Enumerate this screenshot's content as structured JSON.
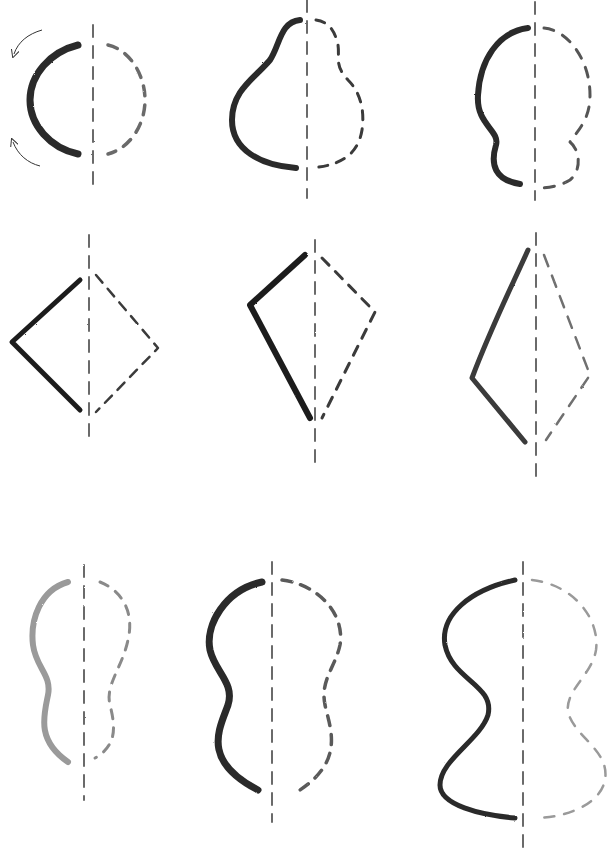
{
  "figure": {
    "colors": {
      "background": "#ffffff",
      "dark_pencil": "#2a2a2a",
      "mid_pencil": "#555555",
      "light_pencil": "#9a9a9a"
    },
    "rows": [
      {
        "name": "round-shapes",
        "shapes": [
          {
            "id": "circle",
            "axis": [
              93,
              25,
              93,
              185
            ],
            "solid": "M 78 45 C 50 52 30 75 30 100 C 30 125 50 148 78 154",
            "dashed": "M 108 45 C 130 50 145 75 145 100 C 145 125 130 148 108 154",
            "stroke": "#2a2a2a",
            "width": 7,
            "dashColor": "#6a6a6a",
            "dash": "10 9",
            "arrows": true
          },
          {
            "id": "pear",
            "axis": [
              307,
              0,
              307,
              198
            ],
            "solid": "M 300 20 C 280 22 280 45 270 60 C 255 78 232 90 232 120 C 232 150 260 165 296 168",
            "dashed": "M 316 20 C 330 22 335 32 338 45 C 340 58 334 65 348 80 C 360 92 365 110 362 130 C 358 155 340 166 310 168",
            "stroke": "#2a2a2a",
            "width": 6,
            "dashColor": "#3a3a3a",
            "dash": "9 9",
            "arrows": false
          },
          {
            "id": "bulb",
            "axis": [
              535,
              2,
              535,
              200
            ],
            "solid": "M 528 28 C 498 32 480 60 478 95 C 476 125 500 130 496 145 C 490 165 495 180 520 184",
            "dashed": "M 544 28 C 568 30 590 60 590 95 C 590 120 578 130 570 142 C 580 150 582 170 570 180 C 560 186 548 188 540 188",
            "stroke": "#2a2a2a",
            "width": 6,
            "dashColor": "#555555",
            "dash": "10 10",
            "arrows": false
          }
        ]
      },
      {
        "name": "angular-shapes",
        "shapes": [
          {
            "id": "diamond",
            "axis": [
              89,
              235,
              89,
              445
            ],
            "solid": "M 80 280 L 12 342 L 80 410",
            "dashed": "M 96 275 L 158 348 L 96 412",
            "stroke": "#1f1f1f",
            "width": 5,
            "dashColor": "#3a3a3a",
            "dash": "10 8",
            "arrows": false
          },
          {
            "id": "kite",
            "axis": [
              315,
              240,
              315,
              470
            ],
            "solid": "M 305 255 L 250 305 L 310 418",
            "dashed": "M 322 258 L 375 312 L 322 418",
            "stroke": "#1f1f1f",
            "width": 6,
            "dashColor": "#3a3a3a",
            "dash": "10 9",
            "arrows": false
          },
          {
            "id": "tall-kite",
            "axis": [
              536,
              233,
              536,
              485
            ],
            "solid": "M 528 250 C 510 290 490 330 472 378 L 525 442",
            "dashed": "M 544 255 L 590 375 L 546 440",
            "stroke": "#3a3a3a",
            "width": 5,
            "dashColor": "#707070",
            "dash": "12 10",
            "arrows": false
          }
        ]
      },
      {
        "name": "s-curve-shapes",
        "shapes": [
          {
            "id": "light-vase",
            "axis": [
              84,
              565,
              84,
              800
            ],
            "solid": "M 68 582 C 40 590 30 620 33 645 C 36 668 52 675 48 695 C 44 715 36 740 68 762",
            "dashed": "M 100 582 C 120 590 135 610 128 640 C 122 668 105 685 110 705 C 115 725 118 745 95 758",
            "stroke": "#9a9a9a",
            "width": 6,
            "dashColor": "#8a8a8a",
            "dash": "9 9",
            "arrows": false
          },
          {
            "id": "medium-vase",
            "axis": [
              272,
              562,
              272,
              822
            ],
            "solid": "M 262 582 C 225 590 205 625 210 650 C 215 672 235 683 228 705 C 220 728 200 760 258 790",
            "dashed": "M 282 580 C 320 585 345 615 340 645 C 335 668 320 680 325 705 C 330 728 345 760 300 790",
            "stroke": "#2a2a2a",
            "width": 7,
            "dashColor": "#5a5a5a",
            "dash": "10 9",
            "arrows": false
          },
          {
            "id": "wide-vase",
            "axis": [
              523,
              562,
              523,
              850
            ],
            "solid": "M 515 580 C 470 590 440 615 445 645 C 452 680 495 685 488 715 C 480 740 440 760 440 785 C 440 805 480 815 515 818",
            "dashed": "M 532 580 C 575 585 600 620 596 650 C 592 675 565 690 568 712 C 575 738 610 750 605 780 C 600 805 565 818 535 818",
            "stroke": "#2a2a2a",
            "width": 5,
            "dashColor": "#9a9a9a",
            "dash": "10 10",
            "arrows": false
          }
        ]
      }
    ]
  }
}
